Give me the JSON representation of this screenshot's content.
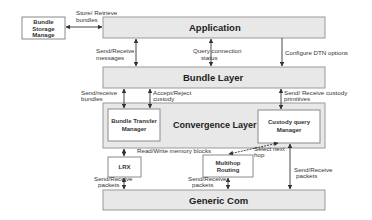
{
  "diagram": {
    "boxes": {
      "bundle_storage": [
        "Bundle",
        "Storage",
        "Manage"
      ],
      "application": "Application",
      "bundle_layer": "Bundle Layer",
      "convergence_layer": "Convergence Layer",
      "bundle_transfer_manager": [
        "Bundle Transfer",
        "Manager"
      ],
      "custody_query_manager": [
        "Custody query",
        "Manager"
      ],
      "lrx": "LRX",
      "multihop_routing": [
        "Multihop",
        "Routing"
      ],
      "generic_com": "Generic Com"
    },
    "edges": {
      "store_retrieve": [
        "Store/ Retrieve",
        "bundles"
      ],
      "send_receive_messages": [
        "Send/Receive",
        "messages"
      ],
      "query_connection": [
        "Query connection",
        "status"
      ],
      "configure_dtn": "Configure DTN options",
      "send_receive_bundles": [
        "Send/receive",
        "bundles"
      ],
      "accept_reject": [
        "Accept/Reject",
        "custody"
      ],
      "send_receive_custody": [
        "Send/ Receive custody",
        "primitives"
      ],
      "read_write_memory": "Read/Write memory blocks",
      "select_next_hop": [
        "Select next",
        "hop"
      ],
      "send_receive_packets_lrx": [
        "Send/Receive",
        "packets"
      ],
      "send_receive_packets_multihop": [
        "Send/Receive",
        "packets"
      ],
      "send_receive_packets_custody": [
        "Send/Receive",
        "packets"
      ]
    }
  }
}
